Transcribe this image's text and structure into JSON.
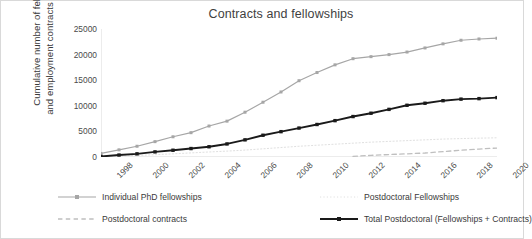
{
  "chart_data": {
    "type": "line",
    "title": "Contracts and fellowships",
    "xlabel": "",
    "ylabel": "Cumulative number of fellowships and employment contracts since 1998",
    "ylabel_line1": "Cumulative number of fellowships",
    "ylabel_line2": "and employment contracts since 1998",
    "grid": false,
    "legend_position": "bottom",
    "xlim": [
      1998,
      2020
    ],
    "ylim": [
      0,
      25000
    ],
    "y_ticks": [
      0,
      5000,
      10000,
      15000,
      20000,
      25000
    ],
    "y_tick_labels": [
      "0",
      "5000",
      "10000",
      "15000",
      "20000",
      "25000"
    ],
    "x_ticks": [
      1998,
      2000,
      2002,
      2004,
      2006,
      2008,
      2010,
      2012,
      2014,
      2016,
      2018,
      2020
    ],
    "x_tick_labels": [
      "1998",
      "2000",
      "2002",
      "2004",
      "2006",
      "2008",
      "2010",
      "2012",
      "2014",
      "2016",
      "2018",
      "2020"
    ],
    "x": [
      1998,
      1999,
      2000,
      2001,
      2002,
      2003,
      2004,
      2005,
      2006,
      2007,
      2008,
      2009,
      2010,
      2011,
      2012,
      2013,
      2014,
      2015,
      2016,
      2017,
      2018,
      2019,
      2020
    ],
    "series": [
      {
        "name": "Individual PhD fellowships",
        "color": "#a6a6a6",
        "style": "solid",
        "marker": "square",
        "width": 1.2,
        "values": [
          700,
          1400,
          2100,
          3000,
          3950,
          4750,
          6050,
          7000,
          8750,
          10700,
          12700,
          14900,
          16500,
          18000,
          19200,
          19600,
          20000,
          20500,
          21300,
          22100,
          22800,
          23050,
          23200
        ]
      },
      {
        "name": "Postdoctoral contracts",
        "color": "#bfbfbf",
        "style": "dashed",
        "marker": "none",
        "width": 1.3,
        "values": [
          null,
          null,
          null,
          null,
          null,
          null,
          null,
          null,
          null,
          null,
          null,
          null,
          null,
          null,
          120,
          320,
          480,
          620,
          780,
          1050,
          1320,
          1550,
          1750
        ]
      },
      {
        "name": "Postdoctoral Fellowships",
        "color": "#e0e0e0",
        "style": "dotted",
        "marker": "none",
        "width": 1.0,
        "values": [
          60,
          180,
          300,
          450,
          620,
          800,
          980,
          1150,
          1350,
          1600,
          1850,
          2100,
          2300,
          2500,
          2700,
          2900,
          3050,
          3200,
          3350,
          3500,
          3600,
          3680,
          3750
        ]
      },
      {
        "name": "Total Postdoctoral (Fellowships + Contracts)",
        "color": "#1a1a1a",
        "style": "solid",
        "marker": "square",
        "width": 1.9,
        "values": [
          100,
          380,
          620,
          1000,
          1320,
          1650,
          2000,
          2550,
          3350,
          4250,
          4950,
          5650,
          6350,
          7100,
          7900,
          8550,
          9300,
          10100,
          10500,
          11000,
          11300,
          11400,
          11600
        ]
      }
    ]
  },
  "legend": [
    {
      "label": "Individual PhD fellowships"
    },
    {
      "label": "Postdoctoral contracts"
    },
    {
      "label": "Postdoctoral Fellowships"
    },
    {
      "label": "Total Postdoctoral (Fellowships + Contracts)"
    }
  ]
}
